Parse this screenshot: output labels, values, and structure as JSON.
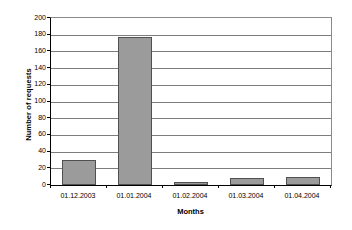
{
  "chart_data": {
    "type": "bar",
    "title": "",
    "xlabel": "Months",
    "ylabel": "Number of requests",
    "categories": [
      "01.12.2003",
      "01.01.2004",
      "01.02.2004",
      "01.03.2004",
      "01.04.2004"
    ],
    "values": [
      30,
      177,
      4,
      9,
      10
    ],
    "series": [
      {
        "name": "Number of requests",
        "values": [
          30,
          177,
          4,
          9,
          10
        ]
      }
    ],
    "ylim": [
      0,
      200
    ],
    "ytick_labels": [
      "200",
      "180",
      "160",
      "140",
      "120",
      "100",
      "80",
      "60",
      "40",
      "20",
      "0"
    ],
    "ytick_values": [
      200,
      180,
      160,
      140,
      120,
      100,
      80,
      60,
      40,
      20,
      0
    ],
    "ytick_step": 20,
    "xlim_categories": 5,
    "grid": "horizontal",
    "legend": "none",
    "legend_position": "none",
    "bar_fill_color": "#9b9b9b",
    "bar_border_color": "#505050",
    "gridline_color": "#7d7d7d",
    "axis_color": "#000000",
    "plot_background": "#ffffff",
    "page_background": "#ffffff"
  }
}
